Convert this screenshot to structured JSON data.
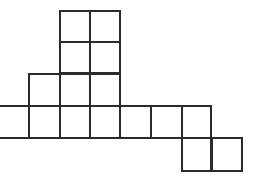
{
  "diagram": {
    "type": "square-grid-polyomino",
    "line_color": "#2b2b2b",
    "background": "#ffffff",
    "cell_count": 17,
    "cells": [
      {
        "x": 59,
        "y": 10,
        "w": 32,
        "h": 33
      },
      {
        "x": 89,
        "y": 10,
        "w": 32,
        "h": 33
      },
      {
        "x": 59,
        "y": 41,
        "w": 32,
        "h": 33
      },
      {
        "x": 89,
        "y": 41,
        "w": 32,
        "h": 33
      },
      {
        "x": 28,
        "y": 73,
        "w": 33,
        "h": 34
      },
      {
        "x": 59,
        "y": 73,
        "w": 32,
        "h": 34
      },
      {
        "x": 89,
        "y": 73,
        "w": 32,
        "h": 34
      },
      {
        "x": -2,
        "y": 105,
        "w": 32,
        "h": 34
      },
      {
        "x": 28,
        "y": 105,
        "w": 33,
        "h": 34
      },
      {
        "x": 59,
        "y": 105,
        "w": 32,
        "h": 34
      },
      {
        "x": 89,
        "y": 105,
        "w": 32,
        "h": 34
      },
      {
        "x": 119,
        "y": 105,
        "w": 33,
        "h": 34
      },
      {
        "x": 150,
        "y": 105,
        "w": 33,
        "h": 34
      },
      {
        "x": 181,
        "y": 105,
        "w": 31,
        "h": 34
      },
      {
        "x": 181,
        "y": 137,
        "w": 31,
        "h": 35
      },
      {
        "x": 211,
        "y": 137,
        "w": 32,
        "h": 35
      }
    ]
  }
}
